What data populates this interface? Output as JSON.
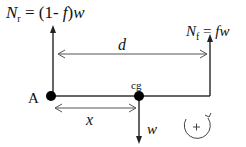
{
  "diagram": {
    "rear_force": {
      "symbol": "N",
      "subscript": "r",
      "expression": "= (1- ",
      "f": "f",
      "close": ")",
      "w": "w"
    },
    "front_force": {
      "symbol": "N",
      "subscript": "f",
      "expression": "= ",
      "fw": "fw"
    },
    "distance_label": "d",
    "x_label": "x",
    "point_a_label": "A",
    "cg_label": "cg",
    "weight_label": "w",
    "sign_convention": "+",
    "colors": {
      "line": "#222222",
      "background": "#ffffff"
    }
  }
}
